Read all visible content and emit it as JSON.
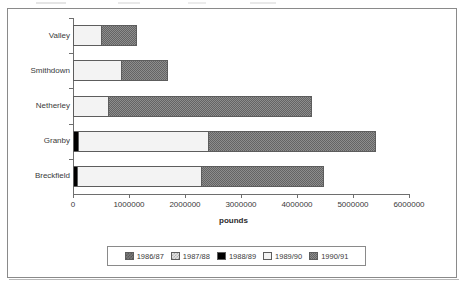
{
  "chart_data": {
    "type": "bar",
    "orientation": "horizontal",
    "stacked": true,
    "title": "",
    "xlabel": "pounds",
    "ylabel": "",
    "xlim": [
      0,
      6000000
    ],
    "xticks": [
      0,
      1000000,
      2000000,
      3000000,
      4000000,
      5000000,
      6000000
    ],
    "xtick_labels": [
      "0",
      "1000000",
      "2000000",
      "3000000",
      "4000000",
      "5000000",
      "6000000"
    ],
    "grid": false,
    "legend_position": "bottom",
    "categories": [
      "Valley",
      "Smithdown",
      "Netherley",
      "Granby",
      "Breckfield"
    ],
    "series": [
      {
        "name": "1986/87",
        "values": [
          0,
          0,
          0,
          0,
          0
        ]
      },
      {
        "name": "1987/88",
        "values": [
          0,
          0,
          0,
          0,
          0
        ]
      },
      {
        "name": "1988/89",
        "values": [
          0,
          0,
          0,
          90000,
          70000
        ]
      },
      {
        "name": "1989/90",
        "values": [
          500000,
          850000,
          620000,
          2320000,
          2220000
        ]
      },
      {
        "name": "1990/91",
        "values": [
          650000,
          850000,
          3650000,
          3000000,
          2200000
        ]
      }
    ],
    "totals": [
      1150000,
      1700000,
      4270000,
      5410000,
      4490000
    ]
  },
  "legend": {
    "items": [
      {
        "label": "1986/87",
        "swatch": "pattern-dark-check"
      },
      {
        "label": "1987/88",
        "swatch": "pattern-light-check"
      },
      {
        "label": "1988/89",
        "swatch": "solid-black"
      },
      {
        "label": "1989/90",
        "swatch": "solid-white"
      },
      {
        "label": "1990/91",
        "swatch": "pattern-medium-check"
      }
    ]
  }
}
